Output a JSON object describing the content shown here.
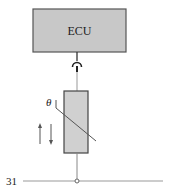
{
  "diagram": {
    "type": "circuit-schematic",
    "ecu": {
      "label": "ECU",
      "fill": "#c8c8c8",
      "stroke": "#555555"
    },
    "sensor": {
      "type": "temperature-dependent-resistor",
      "symbol_label": "θ",
      "fill": "#d0d0d0",
      "stroke": "#555555",
      "arrows": [
        "up",
        "down"
      ]
    },
    "ground_line": {
      "label": "31",
      "color": "#888888"
    },
    "connector": {
      "type": "plug-connector"
    }
  }
}
